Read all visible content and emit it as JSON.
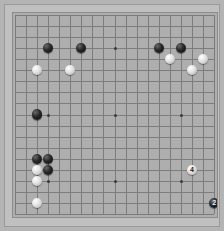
{
  "app": {
    "title": "Go Board",
    "background_color": "#b4b4b4",
    "board_color": "#aeaeae",
    "frame_color": "#c0c0c0",
    "line_color": "#7c7c7c"
  },
  "board": {
    "size": 19,
    "label": "19x19 Go board",
    "hoshi_indices": [
      3,
      9,
      15
    ],
    "grid_origin_x": 9.8,
    "grid_origin_y": 9.8,
    "grid_step": 11.08,
    "stone_radius": 5.2
  },
  "chart_data": {
    "type": "table",
    "xlabel": "column (0-18, left to right)",
    "ylabel": "row (0-18, top to bottom)",
    "columns": [
      "color",
      "col",
      "row",
      "number"
    ],
    "stones": [
      {
        "color": "black",
        "col": 3,
        "row": 3,
        "number": ""
      },
      {
        "color": "black",
        "col": 6,
        "row": 3,
        "number": ""
      },
      {
        "color": "black",
        "col": 13,
        "row": 3,
        "number": ""
      },
      {
        "color": "black",
        "col": 15,
        "row": 3,
        "number": ""
      },
      {
        "color": "white",
        "col": 2,
        "row": 5,
        "number": ""
      },
      {
        "color": "white",
        "col": 5,
        "row": 5,
        "number": ""
      },
      {
        "color": "white",
        "col": 14,
        "row": 4,
        "number": ""
      },
      {
        "color": "white",
        "col": 17,
        "row": 4,
        "number": ""
      },
      {
        "color": "white",
        "col": 16,
        "row": 5,
        "number": ""
      },
      {
        "color": "black",
        "col": 2,
        "row": 9,
        "number": ""
      },
      {
        "color": "black",
        "col": 2,
        "row": 13,
        "number": ""
      },
      {
        "color": "black",
        "col": 3,
        "row": 13,
        "number": ""
      },
      {
        "color": "black",
        "col": 3,
        "row": 14,
        "number": ""
      },
      {
        "color": "white",
        "col": 2,
        "row": 14,
        "number": ""
      },
      {
        "color": "white",
        "col": 2,
        "row": 15,
        "number": ""
      },
      {
        "color": "white",
        "col": 2,
        "row": 17,
        "number": ""
      },
      {
        "color": "white",
        "col": 16,
        "row": 14,
        "number": "4"
      },
      {
        "color": "black",
        "col": 18,
        "row": 17,
        "number": "2"
      },
      {
        "color": "white",
        "col": 0,
        "row": 19,
        "number": "5"
      },
      {
        "color": "black",
        "col": 3,
        "row": 19,
        "number": ""
      },
      {
        "color": "black",
        "col": 6,
        "row": 19,
        "number": "3"
      },
      {
        "color": "white",
        "col": 16,
        "row": 19,
        "number": ""
      }
    ]
  }
}
